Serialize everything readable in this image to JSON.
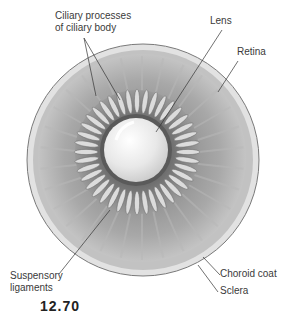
{
  "figure": {
    "number": "12.70"
  },
  "labels": {
    "ciliary_processes_line1": "Ciliary processes",
    "ciliary_processes_line2": "of ciliary body",
    "lens": "Lens",
    "retina": "Retina",
    "suspensory_line1": "Suspensory",
    "suspensory_line2": "ligaments",
    "choroid": "Choroid coat",
    "sclera": "Sclera"
  },
  "colors": {
    "sclera": "#e6e6e6",
    "choroid": "#bcbcbc",
    "retina": "#9e9e9e",
    "processes": "#d8d8d8",
    "lens": "#efefef",
    "leader_line": "#333333"
  }
}
